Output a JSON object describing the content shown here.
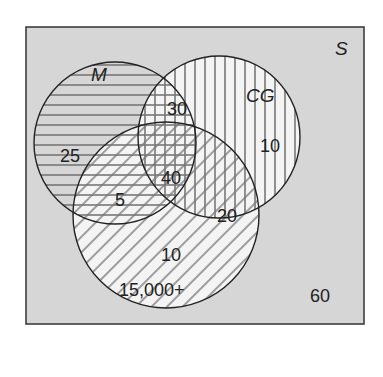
{
  "diagram": {
    "type": "venn",
    "universe_label": "S",
    "sets": [
      {
        "name": "M",
        "pattern": "horizontal-lines"
      },
      {
        "name": "CG",
        "pattern": "vertical-lines"
      },
      {
        "name": "Third set (unlabeled)",
        "pattern": "diagonal-lines"
      }
    ],
    "regions": {
      "m_only": "25",
      "m_cg": "30",
      "cg_only": "10",
      "m_cg_third": "40",
      "m_third": "5",
      "cg_third": "20",
      "third_only_a": "10",
      "third_only_b": "15,000+",
      "outside": "60"
    },
    "colors": {
      "background": "#d6d6d6",
      "circle_fill": "#f4f4f4",
      "stroke": "#222222",
      "hatch": "#777777"
    }
  }
}
